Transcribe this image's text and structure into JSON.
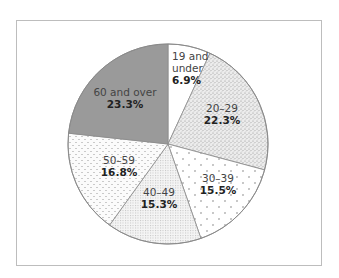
{
  "chart_data": {
    "type": "pie",
    "title": "",
    "start_angle": "12 o'clock",
    "direction": "clockwise",
    "categories": [
      "19 and under",
      "20–29",
      "30–39",
      "40–49",
      "50–59",
      "60 and over"
    ],
    "values": [
      6.9,
      22.3,
      15.5,
      15.3,
      16.8,
      23.3
    ],
    "value_labels": [
      "6.9%",
      "22.3%",
      "15.5%",
      "15.3%",
      "16.8%",
      "23.3%"
    ],
    "slices": [
      {
        "label_lines": [
          "19 and",
          "under"
        ],
        "value": 6.9,
        "value_text": "6.9%",
        "fill": "plain-white",
        "color": "#ffffff",
        "label_pos": [
          172,
          60
        ],
        "align": "start"
      },
      {
        "label_lines": [
          "20–29"
        ],
        "value": 22.3,
        "value_text": "22.3%",
        "fill": "dense-stipple",
        "color": "#e6e6e6",
        "label_pos": [
          222,
          112
        ],
        "align": "middle"
      },
      {
        "label_lines": [
          "30–39"
        ],
        "value": 15.5,
        "value_text": "15.5%",
        "fill": "sparse-cross-dots",
        "color": "#ffffff",
        "label_pos": [
          218,
          182
        ],
        "align": "middle"
      },
      {
        "label_lines": [
          "40–49"
        ],
        "value": 15.3,
        "value_text": "15.3%",
        "fill": "fine-grid-dots",
        "color": "#f0f0f0",
        "label_pos": [
          159,
          196
        ],
        "align": "middle"
      },
      {
        "label_lines": [
          "50–59"
        ],
        "value": 16.8,
        "value_text": "16.8%",
        "fill": "scattered-dots",
        "color": "#f7f7f7",
        "label_pos": [
          119,
          164
        ],
        "align": "middle"
      },
      {
        "label_lines": [
          "60 and over"
        ],
        "value": 23.3,
        "value_text": "23.3%",
        "fill": "solid-gray",
        "color": "#9a9a9a",
        "label_pos": [
          125,
          96
        ],
        "align": "middle"
      }
    ],
    "legend": "none (labels inside slices)",
    "center": [
      168,
      144
    ],
    "radius": 100
  }
}
